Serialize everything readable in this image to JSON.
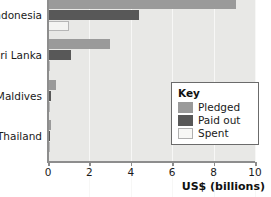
{
  "chart_data": {
    "type": "bar",
    "orientation": "horizontal",
    "title": "",
    "xlabel": "US$ (billions)",
    "ylabel": "",
    "xlim": [
      0,
      10
    ],
    "xticks": [
      0,
      2,
      4,
      6,
      8,
      10
    ],
    "xtick_labels": [
      "0",
      "2",
      "4",
      "6",
      "8",
      "10"
    ],
    "grid": true,
    "grid_axis": "x",
    "legend_position": "inside-right",
    "legend_title": "Key",
    "categories": [
      "Indonesia",
      "Sri Lanka",
      "Maldives",
      "Thailand"
    ],
    "series": [
      {
        "name": "Pledged",
        "color": "#9a9a9a",
        "values": [
          9.1,
          3.0,
          0.4,
          0.15
        ]
      },
      {
        "name": "Paid out",
        "color": "#585858",
        "values": [
          4.4,
          1.1,
          0.15,
          0.08
        ]
      },
      {
        "name": "Spent",
        "color": "#f4f4f2",
        "values": [
          1.0,
          0.1,
          0.05,
          0.03
        ]
      }
    ]
  },
  "axis": {
    "x_title": "US$ (billions)"
  },
  "legend": {
    "title": "Key",
    "items": [
      {
        "label": "Pledged",
        "swatch": "pledged"
      },
      {
        "label": "Paid out",
        "swatch": "paid"
      },
      {
        "label": "Spent",
        "swatch": "spent"
      }
    ]
  }
}
